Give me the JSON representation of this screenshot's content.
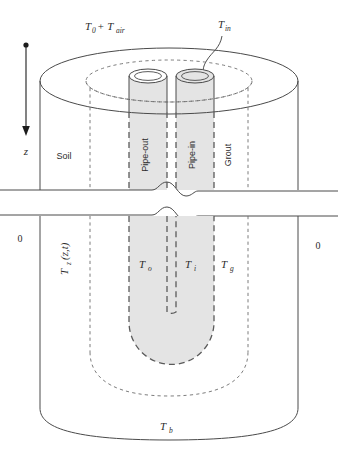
{
  "figure": {
    "title_absent": true,
    "labels": {
      "surface_temperature": "T",
      "surface_temperature_sub": "0",
      "surface_temperature_tail": " + T",
      "surface_temperature_tail_sub": "air",
      "inlet_temperature": "T",
      "inlet_temperature_sub": "in",
      "depth_axis": "z",
      "soil_region": "Soil",
      "pipe_out_region": "Pipe-out",
      "pipe_in_region": "Pipe-in",
      "grout_region": "Grout",
      "soil_temperature": "T",
      "soil_temperature_sub": "z",
      "soil_temperature_tail": "(z,t)",
      "pipe_out_temperature": "T",
      "pipe_out_temperature_sub": "o",
      "pipe_in_temperature": "T",
      "pipe_in_temperature_sub": "i",
      "grout_temperature": "T",
      "grout_temperature_sub": "g",
      "bottom_temperature": "T",
      "bottom_temperature_sub": "b",
      "zero_left": "0",
      "zero_right": "0"
    },
    "colors": {
      "pipe_fill": "#e4e4e4",
      "solid_stroke": "#4a4a4a",
      "dashed_stroke": "#6e6e6e",
      "bold_dashed_stroke": "#5a5a5a",
      "text": "#2b2b2b",
      "background": "#ffffff"
    }
  }
}
